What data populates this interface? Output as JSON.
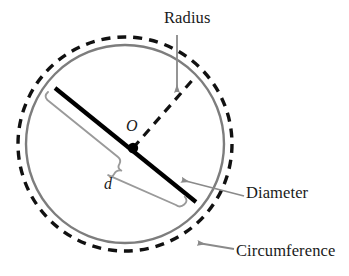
{
  "figure": {
    "kind": "geometry-diagram",
    "labels": {
      "radius": "Radius",
      "diameter": "Diameter",
      "circumference": "Circumference",
      "center_point": "O",
      "diameter_symbol": "d"
    },
    "colors": {
      "circumference_dashed": "#111111",
      "circumference_solid": "#7d7d7d",
      "diameter_line": "#000000",
      "radius_line": "#111111",
      "leader_line": "#8a8a8a",
      "brace": "#9a9a9a",
      "text": "#1a1a1a",
      "background": "#ffffff"
    },
    "geometry": {
      "center_x": 125,
      "center_y": 144,
      "solid_circle_radius": 99,
      "dashed_circle_radius": 107,
      "diameter_start_x": 55,
      "diameter_start_y": 88,
      "diameter_end_x": 196,
      "diameter_end_y": 202,
      "center_dot_x": 133,
      "center_dot_y": 148,
      "center_dot_radius": 5,
      "radius_end_x": 196,
      "radius_end_y": 76
    }
  }
}
